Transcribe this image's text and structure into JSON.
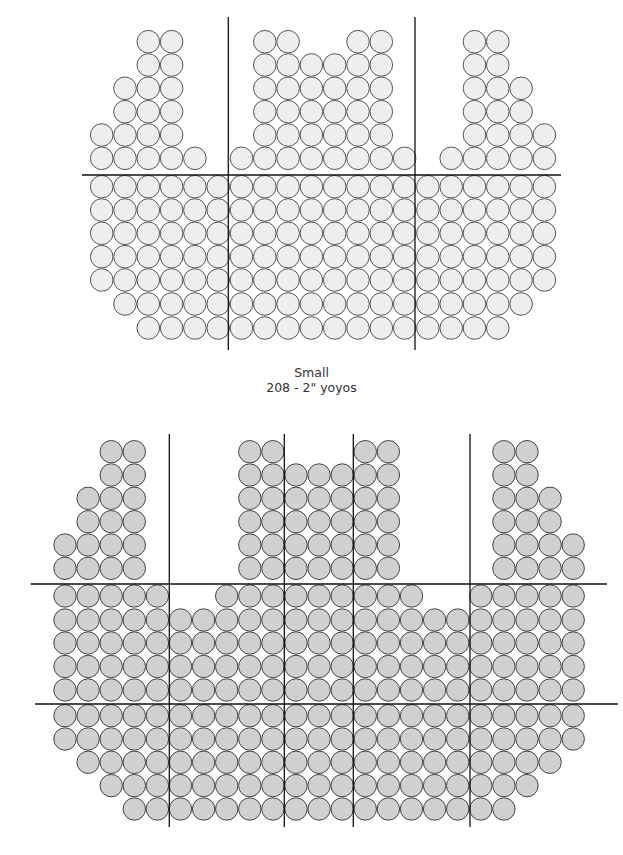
{
  "diagrams": [
    {
      "id": "small",
      "caption_title": "Small",
      "caption_detail": "208 - 2\" yoyos",
      "fill": "#eeeeee",
      "stroke": "#555555",
      "radius": 11.3,
      "col0_x": 101.7,
      "col_pitch": 23.3,
      "rows": [
        {
          "y": 41.7,
          "ranges": [
            [
              2,
              3
            ],
            [
              7,
              8
            ],
            [
              11,
              12
            ],
            [
              16,
              17
            ]
          ]
        },
        {
          "y": 65,
          "ranges": [
            [
              2,
              3
            ],
            [
              7,
              12
            ],
            [
              16,
              17
            ]
          ]
        },
        {
          "y": 88.3,
          "ranges": [
            [
              1,
              3
            ],
            [
              7,
              12
            ],
            [
              16,
              18
            ]
          ]
        },
        {
          "y": 111.7,
          "ranges": [
            [
              1,
              3
            ],
            [
              7,
              12
            ],
            [
              16,
              18
            ]
          ]
        },
        {
          "y": 135,
          "ranges": [
            [
              0,
              3
            ],
            [
              7,
              12
            ],
            [
              16,
              19
            ]
          ]
        },
        {
          "y": 158.3,
          "ranges": [
            [
              0,
              4
            ],
            [
              6,
              13
            ],
            [
              15,
              19
            ]
          ]
        },
        {
          "y": 186.7,
          "ranges": [
            [
              0,
              19
            ]
          ]
        },
        {
          "y": 210,
          "ranges": [
            [
              0,
              19
            ]
          ]
        },
        {
          "y": 233.3,
          "ranges": [
            [
              0,
              19
            ]
          ]
        },
        {
          "y": 256.7,
          "ranges": [
            [
              0,
              19
            ]
          ]
        },
        {
          "y": 280,
          "ranges": [
            [
              0,
              19
            ]
          ]
        },
        {
          "y": 304,
          "ranges": [
            [
              1,
              18
            ]
          ]
        },
        {
          "y": 328,
          "ranges": [
            [
              2,
              17
            ]
          ]
        }
      ],
      "lines": [
        {
          "x1": 82,
          "y1": 175,
          "x2": 561,
          "y2": 175
        },
        {
          "x1": 228.3,
          "y1": 17,
          "x2": 228.3,
          "y2": 350
        },
        {
          "x1": 415,
          "y1": 17,
          "x2": 415,
          "y2": 350
        }
      ]
    },
    {
      "id": "large",
      "fill": "#d0d0d0",
      "stroke": "#444444",
      "radius": 11.2,
      "col0_x": 65,
      "col_pitch": 23.1,
      "rows": [
        {
          "y": 451.7,
          "ranges": [
            [
              2,
              3
            ],
            [
              8,
              9
            ],
            [
              13,
              14
            ],
            [
              19,
              20
            ]
          ]
        },
        {
          "y": 475,
          "ranges": [
            [
              2,
              3
            ],
            [
              8,
              14
            ],
            [
              19,
              20
            ]
          ]
        },
        {
          "y": 498.3,
          "ranges": [
            [
              1,
              3
            ],
            [
              8,
              14
            ],
            [
              19,
              21
            ]
          ]
        },
        {
          "y": 521.7,
          "ranges": [
            [
              1,
              3
            ],
            [
              8,
              14
            ],
            [
              19,
              21
            ]
          ]
        },
        {
          "y": 545,
          "ranges": [
            [
              0,
              3
            ],
            [
              8,
              14
            ],
            [
              19,
              22
            ]
          ]
        },
        {
          "y": 568.3,
          "ranges": [
            [
              0,
              3
            ],
            [
              8,
              14
            ],
            [
              19,
              22
            ]
          ]
        },
        {
          "y": 596,
          "ranges": [
            [
              0,
              4
            ],
            [
              7,
              15
            ],
            [
              18,
              22
            ]
          ]
        },
        {
          "y": 620,
          "ranges": [
            [
              0,
              22
            ]
          ]
        },
        {
          "y": 643,
          "ranges": [
            [
              0,
              22
            ]
          ]
        },
        {
          "y": 666.5,
          "ranges": [
            [
              0,
              22
            ]
          ]
        },
        {
          "y": 690,
          "ranges": [
            [
              0,
              22
            ]
          ]
        },
        {
          "y": 715.7,
          "ranges": [
            [
              0,
              22
            ]
          ]
        },
        {
          "y": 739,
          "ranges": [
            [
              0,
              22
            ]
          ]
        },
        {
          "y": 762.3,
          "ranges": [
            [
              1,
              21
            ]
          ]
        },
        {
          "y": 785.6,
          "ranges": [
            [
              2,
              20
            ]
          ]
        },
        {
          "y": 809,
          "ranges": [
            [
              3,
              19
            ]
          ]
        }
      ],
      "lines": [
        {
          "x1": 30.7,
          "y1": 584,
          "x2": 607,
          "y2": 584
        },
        {
          "x1": 35,
          "y1": 704,
          "x2": 618,
          "y2": 704
        },
        {
          "x1": 169.3,
          "y1": 434,
          "x2": 169.3,
          "y2": 827
        },
        {
          "x1": 284.3,
          "y1": 434,
          "x2": 284.3,
          "y2": 827
        },
        {
          "x1": 353.3,
          "y1": 434,
          "x2": 353.3,
          "y2": 827
        },
        {
          "x1": 470,
          "y1": 434,
          "x2": 470,
          "y2": 827
        }
      ]
    }
  ]
}
